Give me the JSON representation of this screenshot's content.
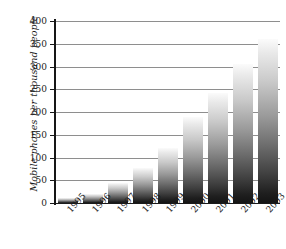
{
  "chart_data": {
    "type": "bar",
    "title": "",
    "subtitle": "",
    "xlabel": "",
    "ylabel": "Mobile phones per thousand people",
    "categories": [
      "1995",
      "1996",
      "1997",
      "1998",
      "1999",
      "2000",
      "2001",
      "2002",
      "2003"
    ],
    "values": [
      12,
      20,
      45,
      78,
      120,
      190,
      242,
      305,
      360
    ],
    "series": [
      {
        "name": "Mobile phones per thousand people",
        "values": [
          12,
          20,
          45,
          78,
          120,
          190,
          242,
          305,
          360
        ]
      }
    ],
    "ylim": [
      0,
      400
    ],
    "xlim_categories": 9,
    "y_ticks": [
      0,
      50,
      100,
      150,
      200,
      250,
      300,
      350,
      400
    ],
    "y_tick_labels": [
      "0",
      "50",
      "100",
      "150",
      "200",
      "250",
      "300",
      "350",
      "400"
    ],
    "grid": "horizontal",
    "legend": "none",
    "bar_fill": "vertical-gradient-white-to-black",
    "colors": {
      "axis": "#161616",
      "gridline": "#8e8e8e",
      "text": "#1c1c1c",
      "background": "#ffffff",
      "bar_top": "#fbfbfb",
      "bar_bottom": "#141414"
    },
    "annotations": []
  }
}
